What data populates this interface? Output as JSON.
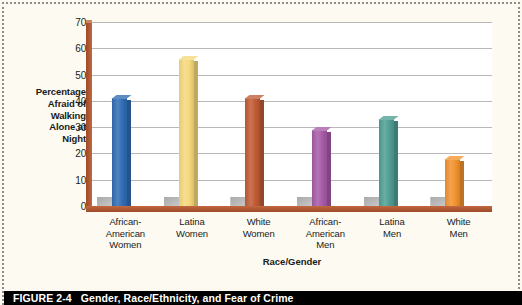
{
  "figure": {
    "caption_number": "FIGURE 2-4",
    "caption_title": "Gender, Race/Ethnicity, and Fear of Crime"
  },
  "chart_data": {
    "type": "bar",
    "title": "",
    "xlabel": "Race/Gender",
    "ylabel": "Percentage Afraid of Walking Alone at Night",
    "categories": [
      "African-American Women",
      "Latina Women",
      "White Women",
      "African-American Men",
      "Latina Men",
      "White Men"
    ],
    "category_lines": [
      [
        "African-",
        "American",
        "Women"
      ],
      [
        "Latina",
        "Women"
      ],
      [
        "White",
        "Women"
      ],
      [
        "African-",
        "American",
        "Men"
      ],
      [
        "Latina",
        "Men"
      ],
      [
        "White",
        "Men"
      ]
    ],
    "values": [
      41,
      56,
      41,
      29,
      33,
      18
    ],
    "colors": [
      "#2f6cb3",
      "#f5d87b",
      "#c05a34",
      "#a65aa6",
      "#4f9e93",
      "#f2922e"
    ],
    "ylim": [
      0,
      70
    ],
    "yticks": [
      0,
      10,
      20,
      30,
      40,
      50,
      60,
      70
    ],
    "ytick_labels": [
      "0",
      "10",
      "20",
      "30",
      "40",
      "50",
      "60",
      "70"
    ],
    "grid": true,
    "legend": "none",
    "axis_color": "#b05233",
    "plot_background": "#ffffff"
  },
  "ylabel_lines": [
    "Percentage",
    "Afraid of",
    "Walking",
    "Alone at",
    "Night"
  ]
}
